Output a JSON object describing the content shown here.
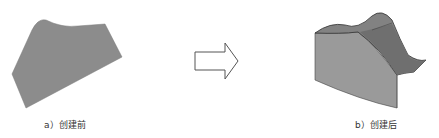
{
  "figure": {
    "before": {
      "caption": "a）创建前",
      "surface_color": "#8c8c8c"
    },
    "arrow": {
      "direction": "right",
      "stroke_color": "#555555"
    },
    "after": {
      "caption": "b）创建后",
      "side_color": "#9a9a9a",
      "top_color": "#7f7f7f",
      "edge_color": "#333333"
    }
  }
}
